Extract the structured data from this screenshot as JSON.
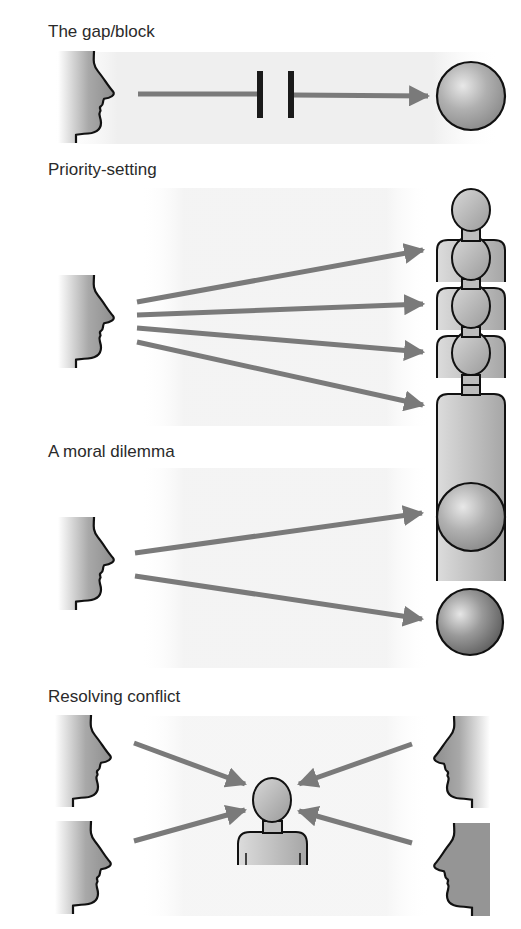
{
  "panels": [
    {
      "id": "gap-block",
      "label": "The gap/block"
    },
    {
      "id": "priority-setting",
      "label": "Priority-setting"
    },
    {
      "id": "moral-dilemma",
      "label": "A moral dilemma"
    },
    {
      "id": "resolving-conflict",
      "label": "Resolving conflict"
    }
  ],
  "colors": {
    "arrow": "#7a7a7a",
    "outline": "#111111",
    "face_fill": "#9a9a9a",
    "background_band": "#eeeeee"
  },
  "icons": {
    "face": "face-profile-icon",
    "sphere": "sphere-icon",
    "person": "person-icon",
    "block": "block-bars-icon"
  }
}
